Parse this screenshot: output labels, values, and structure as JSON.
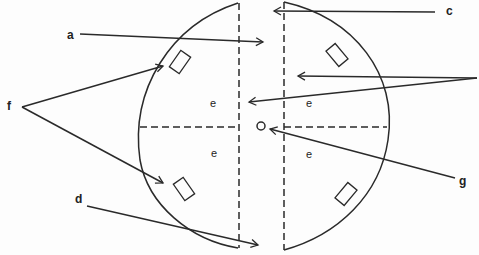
{
  "diagram": {
    "stroke_color": "#2a2a2a",
    "labels": {
      "a": "a",
      "c": "c",
      "d": "d",
      "f": "f",
      "g": "g",
      "e_top_left": "e",
      "e_top_right": "e",
      "e_bottom_left": "e",
      "e_bottom_right": "e"
    }
  }
}
